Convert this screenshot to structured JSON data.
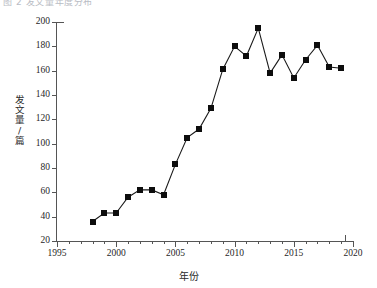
{
  "top_caption": "图 2  发文量年度分布",
  "chart_data": {
    "type": "line",
    "title": "",
    "subtitle": "",
    "xlabel": "年份",
    "ylabel": "发文量/篇",
    "xlim": [
      1995,
      2020
    ],
    "ylim": [
      20,
      200
    ],
    "xticks": [
      1995,
      2000,
      2005,
      2010,
      2015,
      2020
    ],
    "xtick_labels": [
      "1995",
      "2000",
      "2005",
      "2010",
      "2015",
      "2020"
    ],
    "xminor_step": 1,
    "yticks": [
      20,
      40,
      60,
      80,
      100,
      120,
      140,
      160,
      180,
      200
    ],
    "ytick_labels": [
      "20",
      "40",
      "60",
      "80",
      "100",
      "120",
      "140",
      "160",
      "180",
      "200"
    ],
    "grid": false,
    "legend": null,
    "marker": "square",
    "marker_color": "#0d0d0d",
    "line_color": "#1a1a1a",
    "x": [
      1998,
      1999,
      2000,
      2001,
      2002,
      2003,
      2004,
      2005,
      2006,
      2007,
      2008,
      2009,
      2010,
      2011,
      2012,
      2013,
      2014,
      2015,
      2016,
      2017,
      2018,
      2019
    ],
    "values": [
      36,
      43,
      43,
      56,
      62,
      62,
      58,
      83,
      105,
      112,
      129,
      161,
      180,
      172,
      195,
      158,
      173,
      154,
      169,
      181,
      163,
      162
    ],
    "series": [
      {
        "name": "发文量/篇",
        "x": [
          1998,
          1999,
          2000,
          2001,
          2002,
          2003,
          2004,
          2005,
          2006,
          2007,
          2008,
          2009,
          2010,
          2011,
          2012,
          2013,
          2014,
          2015,
          2016,
          2017,
          2018,
          2019
        ],
        "values": [
          36,
          43,
          43,
          56,
          62,
          62,
          58,
          83,
          105,
          112,
          129,
          161,
          180,
          172,
          195,
          158,
          173,
          154,
          169,
          181,
          163,
          162
        ]
      }
    ]
  }
}
